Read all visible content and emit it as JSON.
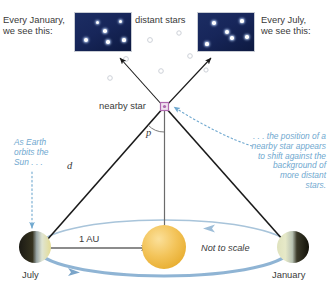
{
  "diagram": {
    "colors": {
      "note_blue": "#6fa8cf",
      "orbit_blue": "#8fb4d4",
      "orbit_arrow_blue": "#6f9cc4",
      "sun_yellow": "#f2c14e",
      "panel_navy": "#17265a",
      "line_black": "#1a1a1a",
      "text_gray": "#3a3a3a",
      "faint_star": "#c9cdd4",
      "star_magenta": "#b06ab0"
    },
    "labels": {
      "left_caption": "Every January,\nwe see this:",
      "right_caption": "Every July,\nwe see this:",
      "distant_stars": "distant stars",
      "nearby_star": "nearby star",
      "angle_p": "p",
      "distance_d": "d",
      "au": "1 AU",
      "not_to_scale": "Not to scale",
      "earth_july": "July",
      "earth_january": "January",
      "note_left": "As Earth\norbits the\nSun . . .",
      "note_right": ". . . the position of a\nnearby star appears\nto shift against the\nbackground of\nmore distant\nstars."
    },
    "star_panels": {
      "january": {
        "stars": [
          {
            "x": 22,
            "y": 9,
            "r": 1.5
          },
          {
            "x": 45,
            "y": 8,
            "r": 1.5
          },
          {
            "x": 30,
            "y": 18,
            "r": 1.8
          },
          {
            "x": 11,
            "y": 27,
            "r": 2.3
          },
          {
            "x": 33,
            "y": 29,
            "r": 1.7
          },
          {
            "x": 49,
            "y": 27,
            "r": 1.6
          }
        ]
      },
      "july": {
        "stars": [
          {
            "x": 16,
            "y": 10,
            "r": 1.7
          },
          {
            "x": 44,
            "y": 8,
            "r": 1.6
          },
          {
            "x": 29,
            "y": 19,
            "r": 1.9
          },
          {
            "x": 9,
            "y": 31,
            "r": 1.6
          },
          {
            "x": 34,
            "y": 25,
            "r": 1.7
          },
          {
            "x": 49,
            "y": 24,
            "r": 1.7
          }
        ]
      }
    },
    "faint_stars": [
      {
        "x": 150,
        "y": 40,
        "r": 2.4
      },
      {
        "x": 179,
        "y": 33,
        "r": 2.2
      },
      {
        "x": 190,
        "y": 56,
        "r": 2.3
      },
      {
        "x": 126,
        "y": 59,
        "r": 2.4
      },
      {
        "x": 161,
        "y": 71,
        "r": 2.3
      },
      {
        "x": 110,
        "y": 78,
        "r": 2.3
      },
      {
        "x": 206,
        "y": 70,
        "r": 2.1
      },
      {
        "x": 222,
        "y": 48,
        "r": 2.2
      },
      {
        "x": 99,
        "y": 47,
        "r": 1.9
      }
    ]
  }
}
